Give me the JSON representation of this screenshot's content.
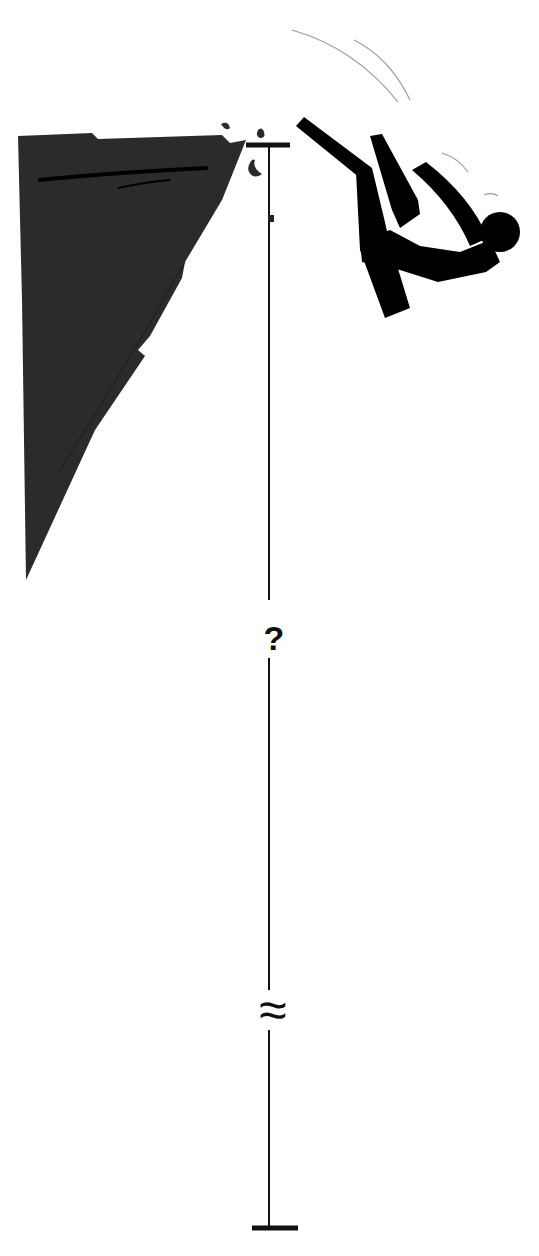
{
  "diagram": {
    "colors": {
      "cliff": "#2b2b2b",
      "figure": "#000000",
      "line": "#111111",
      "motion_lines": "#9a9a9a",
      "background": "#ffffff"
    },
    "height_marker": {
      "label": "?",
      "break_symbol": "≈"
    }
  }
}
